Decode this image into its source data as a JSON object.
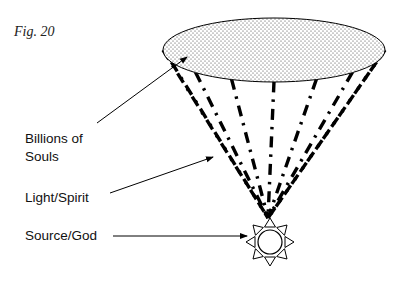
{
  "figure": {
    "label": "Fig. 20"
  },
  "labels": {
    "souls_line1": "Billions of",
    "souls_line2": "Souls",
    "light": "Light/Spirit",
    "source": "Source/God"
  },
  "diagram": {
    "ray_count": 9,
    "ray_style": "dash-dot",
    "top_shape": "stippled ellipse",
    "bottom_shape": "sun"
  },
  "colors": {
    "ink": "#000000",
    "background": "#ffffff"
  }
}
